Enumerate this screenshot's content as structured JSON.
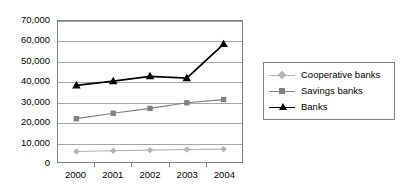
{
  "chart_data": {
    "type": "line",
    "title": "",
    "xlabel": "",
    "ylabel": "",
    "categories": [
      "2000",
      "2001",
      "2002",
      "2003",
      "2004"
    ],
    "ylim": [
      0,
      70000
    ],
    "yticks": [
      0,
      10000,
      20000,
      30000,
      40000,
      50000,
      60000,
      70000
    ],
    "ytick_labels": [
      "0",
      "10,000",
      "20,000",
      "30,000",
      "40,000",
      "50,000",
      "60,000",
      "70,000"
    ],
    "grid": true,
    "legend_position": "right",
    "series": [
      {
        "name": "Cooperative banks",
        "values": [
          5200,
          5600,
          5900,
          6200,
          6400
        ],
        "color": "#b3b3b3",
        "marker": "diamond"
      },
      {
        "name": "Savings banks",
        "values": [
          21500,
          24200,
          26600,
          29400,
          31000
        ],
        "color": "#808080",
        "marker": "square"
      },
      {
        "name": "Banks",
        "values": [
          38000,
          40100,
          42500,
          41600,
          58500
        ],
        "color": "#000000",
        "marker": "triangle"
      }
    ]
  },
  "legend": {
    "items": [
      {
        "label": "Cooperative banks"
      },
      {
        "label": "Savings banks"
      },
      {
        "label": "Banks"
      }
    ]
  },
  "colors": {
    "background": "#ffffff",
    "gridline": "#a6a6a6",
    "axis": "#808080",
    "text": "#000000"
  }
}
